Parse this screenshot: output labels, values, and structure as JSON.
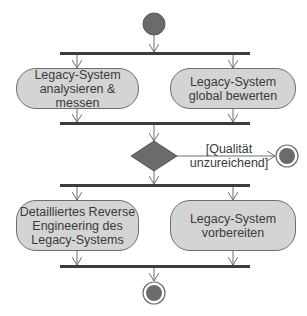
{
  "diagram": {
    "type": "UML activity diagram",
    "activities": [
      {
        "id": "a1",
        "label": "Legacy-System\nanalysieren & messen"
      },
      {
        "id": "a2",
        "label": "Legacy-System\nglobal bewerten"
      },
      {
        "id": "a3",
        "label": "Detailliertes Reverse\nEngineering des\nLegacy-Systems"
      },
      {
        "id": "a4",
        "label": "Legacy-System\nvorbereiten"
      }
    ],
    "decision": {
      "guard": "[Qualität\nunzureichend]"
    },
    "nodes": [
      "initial-node",
      "fork-1",
      "join-1",
      "decision",
      "final-node-right",
      "fork-2",
      "join-2",
      "final-node-bottom"
    ],
    "colors": {
      "activity_fill": "#d4d4d4",
      "node_fill": "#6b6b6b",
      "line": "#6e6e6e",
      "bar": "#3c3c3c"
    }
  }
}
